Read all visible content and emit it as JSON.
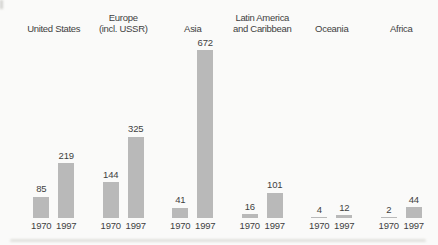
{
  "chart_data": {
    "type": "bar",
    "title": "",
    "categories": [
      "United States",
      "Europe (incl. USSR)",
      "Asia",
      "Latin America and Caribbean",
      "Oceania",
      "Africa"
    ],
    "category_labels": [
      "United States",
      "Europe\n(incl. USSR)",
      "Asia",
      "Latin America\nand Caribbean",
      "Oceania",
      "Africa"
    ],
    "series": [
      {
        "name": "1970",
        "values": [
          85,
          144,
          41,
          16,
          4,
          2
        ]
      },
      {
        "name": "1997",
        "values": [
          219,
          325,
          672,
          101,
          12,
          44
        ]
      }
    ],
    "value_labels_shown": true,
    "axes": "none",
    "grid": "off",
    "legend": "none",
    "ylim": [
      0,
      700
    ],
    "xlabel": "",
    "ylabel": "",
    "colors": {
      "bar": "#b9b9b9",
      "text": "#3f3f3f",
      "background": "#fafaf9"
    }
  }
}
